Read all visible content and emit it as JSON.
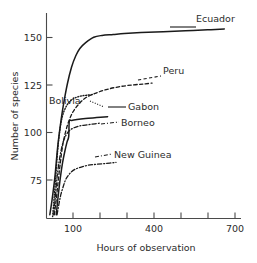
{
  "chart_data": {
    "type": "line",
    "title": "",
    "xlabel": "Hours of observation",
    "ylabel": "Number of species",
    "xlim": [
      60,
      760
    ],
    "ylim": [
      58,
      168
    ],
    "grid": false,
    "legend_position": "inline-labels",
    "xticks": [
      100,
      200,
      300,
      400,
      500,
      600,
      700
    ],
    "xtick_labels": [
      "100",
      "",
      "",
      "400",
      "",
      "",
      "700"
    ],
    "yticks": [
      75,
      100,
      125,
      150
    ],
    "ytick_labels": [
      "75",
      "100",
      "125",
      "150"
    ],
    "series": [
      {
        "name": "Ecuador",
        "label": "Ecuador",
        "linestyle": "solid",
        "x": [
          72,
          80,
          90,
          100,
          110,
          120,
          135,
          150,
          165,
          180,
          200,
          230,
          260,
          300,
          340,
          400,
          480,
          560,
          640,
          700
        ],
        "y": [
          60,
          68,
          80,
          96,
          108,
          118,
          130,
          139,
          145,
          149,
          152,
          155,
          156,
          156.5,
          157,
          157.5,
          158,
          158.5,
          159,
          159.5
        ]
      },
      {
        "name": "Peru",
        "label": "Peru",
        "linestyle": "dashed",
        "x": [
          88,
          95,
          102,
          110,
          118,
          128,
          140,
          155,
          175,
          200,
          235,
          275,
          320,
          370,
          410,
          440
        ],
        "y": [
          60,
          68,
          78,
          88,
          97,
          104,
          110,
          115,
          119,
          122.5,
          125,
          127,
          128.5,
          129.5,
          130,
          130.5
        ]
      },
      {
        "name": "Bolivia",
        "label": "Bolivia",
        "linestyle": "dotted",
        "x": [
          82,
          88,
          94,
          100,
          106,
          113,
          122,
          133,
          146,
          162,
          182,
          205,
          230
        ],
        "y": [
          59,
          70,
          82,
          94,
          103,
          110,
          115,
          118.5,
          121,
          122.5,
          123.5,
          124,
          124.5
        ]
      },
      {
        "name": "Gabon",
        "label": "Gabon",
        "linestyle": "solid",
        "x": [
          95,
          102,
          110,
          118,
          126,
          134,
          140,
          142,
          150,
          170,
          200,
          240,
          280
        ],
        "y": [
          60,
          70,
          80,
          88,
          94,
          99,
          102,
          110,
          110.5,
          111,
          111.5,
          112,
          112.5
        ]
      },
      {
        "name": "Borneo",
        "label": "Borneo",
        "linestyle": "dashdot",
        "x": [
          86,
          92,
          98,
          105,
          112,
          120,
          130,
          142,
          158,
          178,
          200,
          225,
          250
        ],
        "y": [
          60,
          70,
          80,
          88,
          94,
          99,
          102.5,
          105,
          106.5,
          107.5,
          108,
          108.5,
          109
        ]
      },
      {
        "name": "New Guinea",
        "label": "New Guinea",
        "linestyle": "dashdot",
        "x": [
          98,
          105,
          112,
          120,
          128,
          138,
          150,
          165,
          185,
          210,
          240,
          275,
          310
        ],
        "y": [
          60,
          66,
          71,
          75,
          78.5,
          81,
          83,
          84.5,
          85.5,
          86.5,
          87,
          87.5,
          88
        ]
      }
    ],
    "annotations": [
      {
        "name": "Ecuador",
        "text": "Ecuador",
        "x_px": 196,
        "y_px": 22,
        "anchor": "start"
      },
      {
        "name": "Peru",
        "text": "Peru",
        "x_px": 163,
        "y_px": 74,
        "anchor": "start"
      },
      {
        "name": "Bolivia",
        "text": "Bolivia",
        "x_px": 49,
        "y_px": 104,
        "anchor": "start"
      },
      {
        "name": "Gabon",
        "text": "Gabon",
        "x_px": 128,
        "y_px": 110,
        "anchor": "start"
      },
      {
        "name": "Borneo",
        "text": "Borneo",
        "x_px": 121,
        "y_px": 126,
        "anchor": "start"
      },
      {
        "name": "New Guinea",
        "text": "New Guinea",
        "x_px": 114,
        "y_px": 158,
        "anchor": "start"
      }
    ]
  },
  "axes": {
    "y_title": "Number of species",
    "x_title": "Hours of observation",
    "y_tick_150": "150",
    "y_tick_125": "125",
    "y_tick_100": "100",
    "y_tick_75": "75",
    "x_tick_100": "100",
    "x_tick_400": "400",
    "x_tick_700": "700"
  },
  "colors": {
    "ink": "#1a1a1a",
    "axis": "#4a4a4a",
    "background": "#ffffff"
  }
}
